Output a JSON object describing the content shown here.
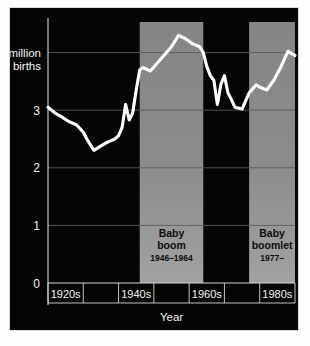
{
  "chart_data": {
    "type": "line",
    "title": "",
    "xlabel": "Year",
    "ylabel": "",
    "ylim": [
      0,
      4.6
    ],
    "xlim": [
      1920,
      1990
    ],
    "grid": true,
    "legend_position": "none",
    "y_ticks": [
      {
        "value": 0,
        "label": "0"
      },
      {
        "value": 1,
        "label": "1"
      },
      {
        "value": 2,
        "label": "2"
      },
      {
        "value": 3,
        "label": "3"
      },
      {
        "value": 4,
        "label_line1": "4 million",
        "label_line2": "births"
      }
    ],
    "x_ticks": [
      {
        "value": 1925,
        "label": "1920s"
      },
      {
        "value": 1945,
        "label": "1940s"
      },
      {
        "value": 1965,
        "label": "1960s"
      },
      {
        "value": 1985,
        "label": "1980s"
      }
    ],
    "x_cell_edges": [
      1920,
      1930,
      1940,
      1950,
      1960,
      1970,
      1980,
      1990
    ],
    "series": [
      {
        "name": "Births",
        "color": "#ffffff",
        "x": [
          1920,
          1922,
          1924,
          1926,
          1928,
          1930,
          1931,
          1933,
          1935,
          1937,
          1939,
          1940,
          1941,
          1942,
          1943,
          1944,
          1945,
          1946,
          1947,
          1949,
          1951,
          1953,
          1955,
          1957,
          1959,
          1961,
          1963,
          1964,
          1965,
          1966,
          1967,
          1968,
          1969,
          1970,
          1971,
          1972,
          1973,
          1975,
          1977,
          1979,
          1980,
          1982,
          1984,
          1986,
          1988,
          1990
        ],
        "y": [
          3.05,
          2.95,
          2.88,
          2.8,
          2.75,
          2.62,
          2.5,
          2.3,
          2.38,
          2.45,
          2.5,
          2.56,
          2.7,
          3.1,
          2.83,
          2.95,
          3.35,
          3.7,
          3.74,
          3.68,
          3.82,
          3.96,
          4.1,
          4.3,
          4.24,
          4.15,
          4.1,
          4.0,
          3.76,
          3.6,
          3.52,
          3.1,
          3.45,
          3.6,
          3.3,
          3.18,
          3.05,
          3.02,
          3.3,
          3.44,
          3.4,
          3.35,
          3.52,
          3.75,
          4.02,
          3.95
        ]
      }
    ],
    "bands": [
      {
        "id": "baby-boom",
        "title": "Baby\nboom",
        "title_line1": "Baby",
        "title_line2": "boom",
        "subtitle": "1946–1964",
        "x_start": 1946,
        "x_end": 1964,
        "color": "#8a8a8a"
      },
      {
        "id": "baby-boomlet",
        "title_line1": "Baby",
        "title_line2": "boomlet",
        "subtitle": "1977–",
        "x_start": 1977,
        "x_end": 1990,
        "color": "#8a8a8a"
      }
    ],
    "colors": {
      "background": "#050505",
      "line": "#ffffff",
      "grid": "#5a5a5a",
      "axis": "#d6d6d6",
      "band": "#8a8a8a",
      "text": "#f4f4f4"
    }
  }
}
